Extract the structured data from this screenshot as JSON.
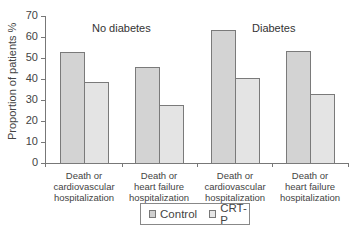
{
  "chart_data": {
    "type": "bar",
    "title": "",
    "xlabel": "",
    "ylabel": "Proportion of patients %",
    "ylim": [
      0,
      70
    ],
    "yticks": [
      0,
      10,
      20,
      30,
      40,
      50,
      60,
      70
    ],
    "grid": false,
    "legend_position": "bottom",
    "panels": [
      "No diabetes",
      "Diabetes"
    ],
    "categories": [
      "No diabetes: Death or cardiovascular hospitalization",
      "No diabetes: Death or heart failure hospitalization",
      "Diabetes: Death or cardiovascular hospitalization",
      "Diabetes: Death or heart failure hospitalization"
    ],
    "series": [
      {
        "name": "Control",
        "values": [
          53,
          45.5,
          63.5,
          53.5
        ]
      },
      {
        "name": "CRT-P",
        "values": [
          38.5,
          27.5,
          40.5,
          33
        ]
      }
    ]
  },
  "panel_titles": {
    "left": "No diabetes",
    "right": "Diabetes"
  },
  "y_axis": {
    "label": "Proportion of patients %",
    "ticks": [
      "0",
      "10",
      "20",
      "30",
      "40",
      "50",
      "60",
      "70"
    ]
  },
  "x_labels": [
    [
      "Death or",
      "cardiovascular",
      "hospitalization"
    ],
    [
      "Death or",
      "heart failure",
      "hospitalization"
    ],
    [
      "Death or",
      "cardiovascular",
      "hospitalization"
    ],
    [
      "Death or",
      "heart failure",
      "hospitalization"
    ]
  ],
  "legend": {
    "control": "Control",
    "crtp": "CRT-P"
  },
  "colors": {
    "control": "#d3d3d3",
    "crtp": "#e4e4e4",
    "border": "#7a7a7a"
  }
}
